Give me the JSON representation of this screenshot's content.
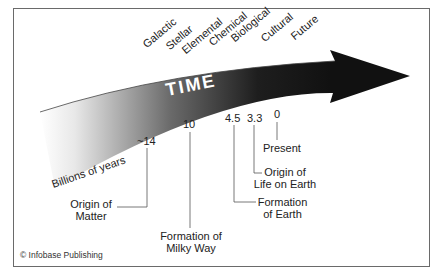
{
  "diagram": {
    "title": "TIME",
    "axis_label": "Billions of years",
    "eras": [
      "Galactic",
      "Stellar",
      "Elemental",
      "Chemical",
      "Biological",
      "Cultural",
      "Future"
    ],
    "ticks": [
      {
        "value": "~14",
        "event": "Origin of Matter",
        "event_lines": [
          "Origin of",
          "Matter"
        ]
      },
      {
        "value": "10",
        "event": "Formation of Milky Way",
        "event_lines": [
          "Formation of",
          "Milky Way"
        ]
      },
      {
        "value": "4.5",
        "event": "Formation of Earth",
        "event_lines": [
          "Formation",
          "of Earth"
        ]
      },
      {
        "value": "3.3",
        "event": "Origin of Life on Earth",
        "event_lines": [
          "Origin of",
          "Life on Earth"
        ]
      },
      {
        "value": "0",
        "event": "Present",
        "event_lines": [
          "Present"
        ]
      }
    ],
    "credit": "© Infobase Publishing",
    "colors": {
      "arrow_dark": "#111111",
      "arrow_light": "#ffffff",
      "border": "#6a6a6a",
      "leader": "#555555"
    }
  }
}
